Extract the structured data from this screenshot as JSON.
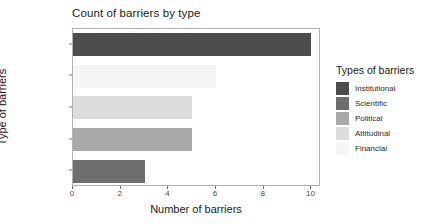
{
  "chart_data": {
    "type": "bar",
    "orientation": "horizontal",
    "title": "Count of barriers by type",
    "xlabel": "Number of barriers",
    "ylabel": "Type of barriers",
    "categories": [
      "Institutional",
      "Financial",
      "Attitudinal",
      "Political",
      "Scientific"
    ],
    "values": [
      10,
      6,
      5,
      5,
      3
    ],
    "xlim": [
      0,
      10.4
    ],
    "xticks": [
      0,
      2,
      4,
      6,
      8,
      10
    ],
    "xtick_labels": [
      "0",
      "2",
      "4",
      "6",
      "8",
      "10"
    ],
    "grid": false,
    "legend_position": "right",
    "legend_title": "Types of barriers",
    "legend_entries": [
      {
        "label": "Institutional",
        "color": "#4d4d4d"
      },
      {
        "label": "Scientific",
        "color": "#6e6e6e"
      },
      {
        "label": "Political",
        "color": "#a9a9a9"
      },
      {
        "label": "Attitudinal",
        "color": "#dcdcdc"
      },
      {
        "label": "Financial",
        "color": "#f5f5f5"
      }
    ],
    "bar_colors": [
      "#4d4d4d",
      "#f5f5f5",
      "#dcdcdc",
      "#a9a9a9",
      "#6e6e6e"
    ]
  }
}
